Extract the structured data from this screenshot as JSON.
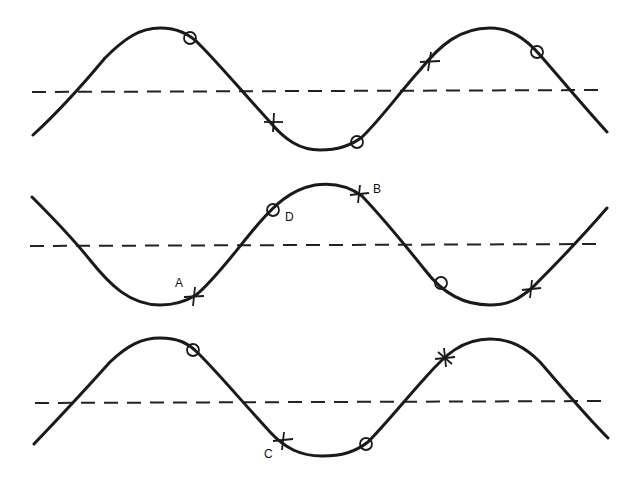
{
  "diagram": {
    "colors": {
      "line": "#1a1a1a",
      "background": "#ffffff"
    },
    "labels": {
      "A": "A",
      "B": "B",
      "C": "C",
      "D": "D"
    },
    "waves": [
      {
        "name": "wave-top",
        "axis_y": 91,
        "circles": [
          [
            190,
            38
          ],
          [
            357,
            142
          ],
          [
            537,
            52
          ]
        ],
        "crosses": [
          [
            273,
            122
          ],
          [
            429,
            61
          ]
        ]
      },
      {
        "name": "wave-middle",
        "axis_y": 245,
        "circles": [
          [
            273,
            210
          ],
          [
            441,
            283
          ]
        ],
        "crosses": [
          [
            194,
            297
          ],
          [
            359,
            194
          ],
          [
            531,
            289
          ]
        ],
        "point_labels": [
          {
            "text": "A",
            "x": 175,
            "y": 287
          },
          {
            "text": "B",
            "x": 373,
            "y": 193
          },
          {
            "text": "D",
            "x": 285,
            "y": 218
          }
        ]
      },
      {
        "name": "wave-bottom",
        "axis_y": 402,
        "circles": [
          [
            193,
            350
          ],
          [
            366,
            444
          ]
        ],
        "crosses": [
          [
            283,
            440
          ],
          [
            444,
            358
          ]
        ],
        "point_labels": [
          {
            "text": "C",
            "x": 264,
            "y": 456
          }
        ]
      }
    ]
  }
}
